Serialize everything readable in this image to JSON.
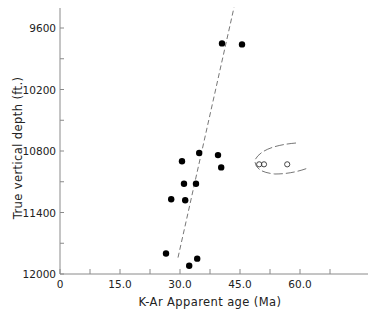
{
  "chart_data": {
    "type": "scatter",
    "title": "",
    "xlabel": "K-Ar Apparent age (Ma)",
    "ylabel": "True vertical depth (ft.)",
    "xlim": [
      0,
      77
    ],
    "ylim": [
      12000,
      9400
    ],
    "y_inverted": true,
    "grid": false,
    "x_ticks": [
      0,
      7.5,
      15,
      22.5,
      30,
      37.5,
      45,
      52.5,
      60,
      67.5
    ],
    "x_tick_labels": [
      "0",
      "",
      "15.0",
      "",
      "30.0",
      "",
      "45.0",
      "",
      "60.0",
      ""
    ],
    "y_ticks": [
      9600,
      9900,
      10200,
      10500,
      10800,
      11100,
      11400,
      11700,
      12000
    ],
    "y_tick_labels": [
      "9600",
      "",
      "10200",
      "",
      "10800",
      "",
      "11400",
      "",
      "12000"
    ],
    "series": [
      {
        "name": "filled",
        "marker": "filled-circle",
        "points": [
          {
            "x": 40.5,
            "y": 9750
          },
          {
            "x": 45.5,
            "y": 9760
          },
          {
            "x": 30.5,
            "y": 10900
          },
          {
            "x": 34.8,
            "y": 10820
          },
          {
            "x": 39.5,
            "y": 10840
          },
          {
            "x": 40.3,
            "y": 10960
          },
          {
            "x": 31.0,
            "y": 11120
          },
          {
            "x": 34.0,
            "y": 11120
          },
          {
            "x": 27.8,
            "y": 11270
          },
          {
            "x": 31.3,
            "y": 11280
          },
          {
            "x": 26.5,
            "y": 11800
          },
          {
            "x": 34.3,
            "y": 11850
          },
          {
            "x": 32.3,
            "y": 11920
          }
        ]
      },
      {
        "name": "open",
        "marker": "open-circle",
        "points": [
          {
            "x": 49.8,
            "y": 10930
          },
          {
            "x": 51.0,
            "y": 10930
          },
          {
            "x": 56.8,
            "y": 10930
          }
        ]
      }
    ],
    "annotations": [
      {
        "type": "dashed-line",
        "from": {
          "x": 29.5,
          "y": 11840
        },
        "to": {
          "x": 43.5,
          "y": 9400
        },
        "label": "trend line"
      },
      {
        "type": "dashed-ellipse",
        "around": "open",
        "label": "outlier group"
      }
    ]
  }
}
